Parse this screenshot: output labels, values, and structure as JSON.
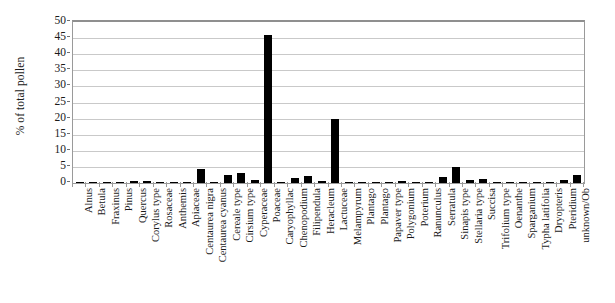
{
  "chart_data": {
    "type": "bar",
    "title": "",
    "xlabel": "",
    "ylabel": "% of total pollen",
    "ylim": [
      0,
      50
    ],
    "ytick_step": 5,
    "yticks": [
      50,
      45,
      40,
      35,
      30,
      25,
      20,
      15,
      10,
      5,
      0
    ],
    "grid": true,
    "legend": "none",
    "bar_color": "#000000",
    "grid_color": "#c9c9c9",
    "frame_color": "#9a9a9a",
    "categories": [
      "Alnus",
      "Betula",
      "Fraxinus",
      "Pinus",
      "Quercus",
      "Corylus type",
      "Rosaceae",
      "Anthemis",
      "Apiaceae",
      "Centaurea nigra",
      "Centaurea cyanus",
      "Cereale type",
      "Cirsium type",
      "Cyperaceae",
      "Poaceae",
      "Caryophyllac",
      "Chenopodium",
      "Filipendula",
      "Heracleum",
      "Lactuceae",
      "Melampyrum",
      "Plantago",
      "Plantago",
      "Papaver type",
      "Polygonium",
      "Poterium",
      "Ranunculus",
      "Serratula",
      "Sinapis type",
      "Stellaria type",
      "Succisa",
      "Trifolium type",
      "Oenanthe",
      "Sparganium",
      "Typha latifolia",
      "Dryopteris",
      "Pteridium",
      "unknown/Ob"
    ],
    "values": [
      0.3,
      0.2,
      0.2,
      0.2,
      0.7,
      0.5,
      0.2,
      0.2,
      0.3,
      4.2,
      0.3,
      2.6,
      3.0,
      1.0,
      46.0,
      0.3,
      1.6,
      2.3,
      0.5,
      20.0,
      0.2,
      0.3,
      0.3,
      0.3,
      0.5,
      0.2,
      0.3,
      2.0,
      5.0,
      0.9,
      1.4,
      0.3,
      0.2,
      0.4,
      0.3,
      0.4,
      1.0,
      2.6
    ]
  }
}
